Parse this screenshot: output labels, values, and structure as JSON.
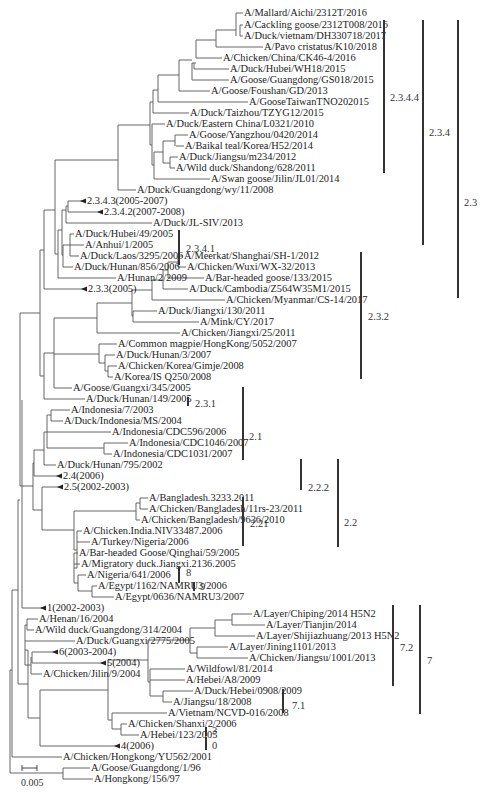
{
  "figure": {
    "type": "phylogenetic-tree",
    "scale_bar": "0.005"
  },
  "leaves": [
    {
      "label": "A/Mallard/Aichi/2312T/2016",
      "x": 243,
      "y": 13,
      "from": 236
    },
    {
      "label": "A/Cackling goose/2312T008/2016",
      "x": 243,
      "y": 25,
      "from": 240
    },
    {
      "label": "A/Duck/vietnam/DH330718/2017",
      "x": 243,
      "y": 36,
      "from": 240
    },
    {
      "label": "A/Pavo cristatus/K10/2018",
      "x": 263,
      "y": 47,
      "from": 216
    },
    {
      "label": "A/Chicken/China/CK46-4/2016",
      "x": 222,
      "y": 58,
      "from": 196
    },
    {
      "label": "A/Duck/Hubei/WH18/2015",
      "x": 229,
      "y": 69,
      "from": 194
    },
    {
      "label": "A/Goose/Guangdong/GS018/2015",
      "x": 229,
      "y": 80,
      "from": 192
    },
    {
      "label": "A/Goose/Foushan/GD/2013",
      "x": 210,
      "y": 91,
      "from": 179
    },
    {
      "label": "A/GooseTaiwanTNO202015",
      "x": 248,
      "y": 102,
      "from": 158
    },
    {
      "label": "A/Duck/Taizhou/TZYG12/2015",
      "x": 189,
      "y": 113,
      "from": 153
    },
    {
      "label": "A/Duck/Eastern China/L0321/2010",
      "x": 165,
      "y": 124,
      "from": 152
    },
    {
      "label": "A/Goose/Yangzhou/0420/2014",
      "x": 188,
      "y": 135,
      "from": 175
    },
    {
      "label": "A/Baikal teal/Korea/H52/2014",
      "x": 184,
      "y": 146,
      "from": 176
    },
    {
      "label": "A/Duck/Jiangsu/m234/2012",
      "x": 178,
      "y": 157,
      "from": 170
    },
    {
      "label": "A/Wild duck/Shandong/628/2011",
      "x": 175,
      "y": 168,
      "from": 170
    },
    {
      "label": "A/Swan goose/Jilin/JL01/2014",
      "x": 210,
      "y": 179,
      "from": 154
    },
    {
      "label": "A/Duck/Guangdong/wy/11/2008",
      "x": 136,
      "y": 190,
      "from": 118
    },
    {
      "label": "2.3.4.3(2005-2007)",
      "x": 86,
      "y": 201,
      "from": 66,
      "collapsed": true
    },
    {
      "label": "2.3.4.2(2007-2008)",
      "x": 103,
      "y": 212,
      "from": 68,
      "collapsed": true
    },
    {
      "label": "A/Duck/JL-SIV/2013",
      "x": 152,
      "y": 223,
      "from": 66
    },
    {
      "label": "A/Duck/Hubei/49/2005",
      "x": 74,
      "y": 234,
      "from": 70
    },
    {
      "label": "A/Anhui/1/2005",
      "x": 84,
      "y": 245,
      "from": 70
    },
    {
      "label": "A/Duck/Laos/3295/2006",
      "x": 79,
      "y": 256,
      "from": 70
    },
    {
      "label": "A/Duck/Hunan/856/2006",
      "x": 73,
      "y": 267,
      "from": 63
    },
    {
      "label": "A/Hunan/2/2009",
      "x": 116,
      "y": 278,
      "from": 58
    },
    {
      "label": "2.3.3(2005)",
      "x": 87,
      "y": 289,
      "from": 44,
      "collapsed": true
    },
    {
      "label": "A/Meerkat/Shanghai/SH-1/2012",
      "x": 183,
      "y": 256,
      "from": 178
    },
    {
      "label": "A/Chicken/Wuxi/WX-32/2013",
      "x": 186,
      "y": 267,
      "from": 178
    },
    {
      "label": "A/Bar-headed goose/133/2015",
      "x": 204,
      "y": 278,
      "from": 168
    },
    {
      "label": "A/Duck/Cambodia/Z564W35M1/2015",
      "x": 188,
      "y": 289,
      "from": 163
    },
    {
      "label": "A/Chicken/Myanmar/CS-14/2017",
      "x": 225,
      "y": 300,
      "from": 152
    },
    {
      "label": "A/Duck/Jiangxi/130/2011",
      "x": 157,
      "y": 311,
      "from": 133
    },
    {
      "label": "A/Mink/CY/2017",
      "x": 199,
      "y": 322,
      "from": 133
    },
    {
      "label": "A/Chicken/Jiangxi/25/2011",
      "x": 180,
      "y": 333,
      "from": 97
    },
    {
      "label": "A/Common magpie/HongKong/5052/2007",
      "x": 117,
      "y": 344,
      "from": 99
    },
    {
      "label": "A/Duck/Hunan/3/2007",
      "x": 115,
      "y": 355,
      "from": 105
    },
    {
      "label": "A/Chicken/Korea/Gimje/2008",
      "x": 117,
      "y": 366,
      "from": 108
    },
    {
      "label": "A/Korea/IS Q250/2008",
      "x": 113,
      "y": 377,
      "from": 108
    },
    {
      "label": "A/Goose/Guangxi/345/2005",
      "x": 72,
      "y": 388,
      "from": 54
    },
    {
      "label": "A/Duck/Hunan/149/2005",
      "x": 85,
      "y": 399,
      "from": 44
    },
    {
      "label": "A/Indonesia/7/2003",
      "x": 70,
      "y": 390,
      "from": 50,
      "y2": 410
    },
    {
      "label": "A/Indonesia/7/2003",
      "x": 70,
      "y": 410,
      "from": 51,
      "skip": true
    },
    {
      "label": "A/Duck/Indonesia/MS/2004",
      "x": 63,
      "y": 421,
      "from": 51
    },
    {
      "label": "A/Indonesia/CDC596/2006",
      "x": 111,
      "y": 432,
      "from": 47
    },
    {
      "label": "A/Indonesia/CDC1046/2007",
      "x": 128,
      "y": 443,
      "from": 104
    },
    {
      "label": "A/Indonesia/CDC1031/2007",
      "x": 112,
      "y": 454,
      "from": 104
    },
    {
      "label": "A/Duck/Hunan/795/2002",
      "x": 56,
      "y": 465,
      "from": 44
    },
    {
      "label": "2.4(2006)",
      "x": 62,
      "y": 476,
      "from": 34,
      "collapsed": true
    },
    {
      "label": "2.5(2002-2003)",
      "x": 63,
      "y": 487,
      "from": 42,
      "collapsed": true
    },
    {
      "label": "A/Bangladesh.3233.2011",
      "x": 148,
      "y": 498,
      "from": 140
    },
    {
      "label": "A/Chicken/Bangladesh/11rs-23/2011",
      "x": 148,
      "y": 509,
      "from": 140
    },
    {
      "label": "A/Chicken/Bangladesh/9636/2010",
      "x": 140,
      "y": 520,
      "from": 136
    },
    {
      "label": "A/Chicken.India.NIV33487.2006",
      "x": 82,
      "y": 531,
      "from": 77
    },
    {
      "label": "A/Turkey/Nigeria/2006",
      "x": 90,
      "y": 542,
      "from": 77
    },
    {
      "label": "A/Bar-headed Goose/Qinghai/59/2005",
      "x": 78,
      "y": 553,
      "from": 74
    },
    {
      "label": "A/Migratory duck.Jiangxi.2136.2005",
      "x": 80,
      "y": 564,
      "from": 74
    },
    {
      "label": "A/Nigeria/641/2006",
      "x": 86,
      "y": 575,
      "from": 78
    },
    {
      "label": "A/Egypt/1162/NAMRU3/2006",
      "x": 97,
      "y": 586,
      "from": 92
    },
    {
      "label": "A/Egypt/0636/NAMRU3/2007",
      "x": 114,
      "y": 597,
      "from": 92
    },
    {
      "label": "1(2002-2003)",
      "x": 46,
      "y": 608,
      "from": 22,
      "collapsed": true
    },
    {
      "label": "A/Henan/16/2004",
      "x": 38,
      "y": 619,
      "from": 27
    },
    {
      "label": "A/Wild duck/Guangdong/314/2004",
      "x": 34,
      "y": 630,
      "from": 27
    },
    {
      "label": "A/Duck/Guangxi/2775/2005",
      "x": 75,
      "y": 641,
      "from": 22
    },
    {
      "label": "6(2003-2004)",
      "x": 58,
      "y": 652,
      "from": 32,
      "collapsed": true
    },
    {
      "label": "5(2004)",
      "x": 106,
      "y": 663,
      "from": 32,
      "collapsed": true
    },
    {
      "label": "A/Chicken/Jilin/9/2004",
      "x": 42,
      "y": 674,
      "from": 31
    },
    {
      "label": "A/Layer/Chiping/2014 H5N2",
      "x": 252,
      "y": 614,
      "from": 232
    },
    {
      "label": "A/Layer/Tianjin/2014",
      "x": 265,
      "y": 625,
      "from": 232
    },
    {
      "label": "A/Layer/Shijiazhuang/2013 H5N2",
      "x": 255,
      "y": 636,
      "from": 215
    },
    {
      "label": "A/Layer/Jining1101/2013",
      "x": 228,
      "y": 647,
      "from": 197
    },
    {
      "label": "A/Chicken/Jiangsu/1001/2013",
      "x": 248,
      "y": 658,
      "from": 197
    },
    {
      "label": "A/Wildfowl/81/2014",
      "x": 185,
      "y": 669,
      "from": 150
    },
    {
      "label": "A/Hebei/A8/2009",
      "x": 185,
      "y": 680,
      "from": 150
    },
    {
      "label": "A/Duck/Hebei/0908/2009",
      "x": 193,
      "y": 691,
      "from": 163
    },
    {
      "label": "A/Jiangsu/18/2008",
      "x": 172,
      "y": 702,
      "from": 163
    },
    {
      "label": "A/Vietnam/NCVD-016/2008",
      "x": 167,
      "y": 713,
      "from": 112
    },
    {
      "label": "A/Chicken/Shanxi/2/2006",
      "x": 127,
      "y": 724,
      "from": 121
    },
    {
      "label": "A/Hebei/123/2005",
      "x": 139,
      "y": 735,
      "from": 121
    },
    {
      "label": "4(2006)",
      "x": 120,
      "y": 746,
      "from": 40,
      "collapsed": true
    },
    {
      "label": "A/Chicken/Hongkong/YU562/2001",
      "x": 62,
      "y": 757,
      "from": 12
    },
    {
      "label": "A/Goose/Guangdong/1/96",
      "x": 90,
      "y": 768,
      "from": 63
    },
    {
      "label": "A/Hongkong/156/97",
      "x": 93,
      "y": 779,
      "from": 63
    }
  ],
  "clades": [
    {
      "label": "2.3.4.4",
      "bar_x": 383,
      "y1": 20,
      "y2": 173,
      "lx": 390,
      "ly": 92
    },
    {
      "label": "2.3.4",
      "bar_x": 422,
      "y1": 20,
      "y2": 245,
      "lx": 429,
      "ly": 127
    },
    {
      "label": "2.3",
      "bar_x": 457,
      "y1": 20,
      "y2": 298,
      "lx": 464,
      "ly": 197
    },
    {
      "label": "2.3.4.1",
      "bar_x": 178,
      "y1": 230,
      "y2": 265,
      "lx": 186,
      "ly": 243
    },
    {
      "label": "2.3.2",
      "bar_x": 360,
      "y1": 252,
      "y2": 379,
      "lx": 368,
      "ly": 311
    },
    {
      "label": "2.3.1",
      "bar_x": 187,
      "y1": 397,
      "y2": 406,
      "lx": 195,
      "ly": 398
    },
    {
      "label": "2.1",
      "bar_x": 242,
      "y1": 387,
      "y2": 460,
      "lx": 249,
      "ly": 431
    },
    {
      "label": "2.2.2",
      "bar_x": 300,
      "y1": 459,
      "y2": 490,
      "lx": 308,
      "ly": 482
    },
    {
      "label": "2.2",
      "bar_x": 337,
      "y1": 459,
      "y2": 547,
      "lx": 344,
      "ly": 517
    },
    {
      "label": "2.21",
      "bar_x": 242,
      "y1": 497,
      "y2": 546,
      "lx": 250,
      "ly": 518
    },
    {
      "label": "8",
      "bar_x": 178,
      "y1": 567,
      "y2": 583,
      "lx": 186,
      "ly": 567
    },
    {
      "label": "9",
      "bar_x": 193,
      "y1": 582,
      "y2": 591,
      "lx": 200,
      "ly": 581
    },
    {
      "label": "7.2",
      "bar_x": 392,
      "y1": 605,
      "y2": 686,
      "lx": 400,
      "ly": 642
    },
    {
      "label": "7.1",
      "bar_x": 282,
      "y1": 689,
      "y2": 713,
      "lx": 292,
      "ly": 700
    },
    {
      "label": "7",
      "bar_x": 419,
      "y1": 605,
      "y2": 714,
      "lx": 427,
      "ly": 655
    },
    {
      "label": "3",
      "bar_x": 205,
      "y1": 727,
      "y2": 736,
      "lx": 212,
      "ly": 725
    },
    {
      "label": "0",
      "bar_x": 205,
      "y1": 737,
      "y2": 750,
      "lx": 212,
      "ly": 740
    }
  ],
  "scale": {
    "x1": 22,
    "x2": 37,
    "y": 768,
    "label_x": 21,
    "label_y": 775
  }
}
